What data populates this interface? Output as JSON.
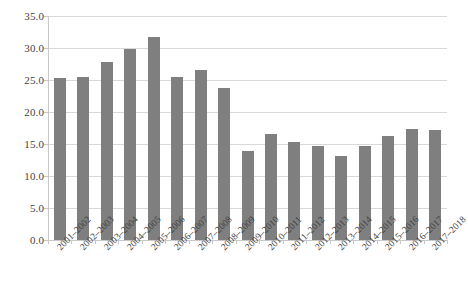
{
  "chart_data": {
    "type": "bar",
    "title": "",
    "subtitle": "",
    "xlabel": "",
    "ylabel": "",
    "categories": [
      "2001–2002",
      "2002–2003",
      "2003–2004",
      "2004–2005",
      "2005–2006",
      "2006–2007",
      "2007–2008",
      "2008–2009",
      "2009–2010",
      "2010–2011",
      "2011–2012",
      "2012–2013",
      "2013–2014",
      "2014–2015",
      "2015–2016",
      "2016–2017",
      "2017–2018"
    ],
    "values": [
      25.3,
      25.4,
      27.8,
      29.8,
      31.7,
      25.4,
      26.6,
      23.7,
      13.9,
      16.6,
      15.3,
      14.7,
      13.2,
      14.7,
      16.3,
      17.4,
      17.2
    ],
    "ylim": [
      0.0,
      35.0
    ],
    "ytick_labels": [
      "0.0",
      "5.0",
      "10.0",
      "15.0",
      "20.0",
      "25.0",
      "30.0",
      "35.0"
    ],
    "ytick_values": [
      0.0,
      5.0,
      10.0,
      15.0,
      20.0,
      25.0,
      30.0,
      35.0
    ],
    "grid": true,
    "legend": false,
    "legend_position": "none",
    "series": [
      {
        "name": "",
        "values": [
          25.3,
          25.4,
          27.8,
          29.8,
          31.7,
          25.4,
          26.6,
          23.7,
          13.9,
          16.6,
          15.3,
          14.7,
          13.2,
          14.7,
          16.3,
          17.4,
          17.2
        ]
      }
    ],
    "colors": {
      "bar": "#7f7f7f",
      "grid": "#d9d9d9",
      "axis": "#c8c8c8",
      "text": "#3f3f3f",
      "background": "#ffffff"
    }
  }
}
